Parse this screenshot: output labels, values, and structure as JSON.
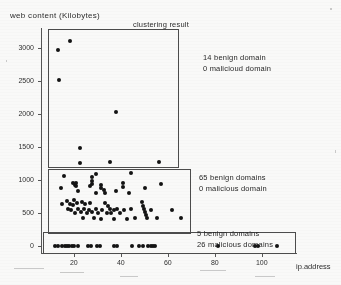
{
  "figure": {
    "title": "clustering result",
    "ylabel": "web  content (Kilobytes)",
    "xlabel": "ip  address"
  },
  "chart_data": {
    "type": "scatter",
    "title": "clustering result",
    "xlabel": "ip  address",
    "ylabel": "web  content (Kilobytes)",
    "xlim": [
      6,
      115
    ],
    "ylim": [
      -120,
      3300
    ],
    "grid": false,
    "legend": "none",
    "xticks": [
      20,
      40,
      60,
      80,
      100
    ],
    "yticks": [
      0,
      500,
      1000,
      1500,
      2000,
      2500,
      3000
    ],
    "xtick_labels": [
      "20",
      "40",
      "60",
      "80",
      "100"
    ],
    "ytick_labels": [
      "0",
      "500",
      "1000",
      "1500",
      "2000",
      "2500",
      "3000"
    ],
    "clusters": [
      {
        "id": 1,
        "annotation": [
          "14 benign domain",
          "0 malicioud domain"
        ],
        "benign": 14,
        "malicious": 0,
        "box": {
          "x0": 8.5,
          "y0": 1180,
          "x1": 64.5,
          "y1": 3290
        },
        "points": [
          [
            13.0,
            2960
          ],
          [
            18.0,
            3105
          ],
          [
            13.2,
            2515
          ],
          [
            37.5,
            2035
          ],
          [
            22.0,
            1490
          ],
          [
            22.2,
            1262
          ],
          [
            35.0,
            1268
          ],
          [
            56.0,
            1272
          ],
          [
            15.5,
            1053
          ],
          [
            19.0,
            960
          ],
          [
            20.2,
            928
          ],
          [
            27.4,
            1040
          ],
          [
            27.4,
            985
          ],
          [
            27.4,
            935
          ]
        ]
      },
      {
        "id": 2,
        "annotation": [
          "65 benign domains",
          "0 malicious domain"
        ],
        "benign": 65,
        "malicious": 0,
        "box": {
          "x0": 8.5,
          "y0": 190,
          "x1": 69.5,
          "y1": 1160
        },
        "points": [
          [
            29.0,
            1090
          ],
          [
            44.0,
            1110
          ],
          [
            14.0,
            880
          ],
          [
            20.5,
            960
          ],
          [
            20.5,
            905
          ],
          [
            21.5,
            840
          ],
          [
            26.5,
            915
          ],
          [
            31.0,
            930
          ],
          [
            31.3,
            878
          ],
          [
            32.5,
            845
          ],
          [
            40.5,
            955
          ],
          [
            40.5,
            890
          ],
          [
            50.0,
            885
          ],
          [
            56.5,
            940
          ],
          [
            29.0,
            800
          ],
          [
            33.0,
            800
          ],
          [
            37.5,
            830
          ],
          [
            43.0,
            800
          ],
          [
            14.5,
            640
          ],
          [
            16.5,
            675
          ],
          [
            18.0,
            640
          ],
          [
            19.5,
            690
          ],
          [
            19.0,
            620
          ],
          [
            21.0,
            650
          ],
          [
            23.0,
            672
          ],
          [
            24.5,
            640
          ],
          [
            26.5,
            655
          ],
          [
            17.0,
            560
          ],
          [
            18.5,
            540
          ],
          [
            20.0,
            505
          ],
          [
            21.5,
            560
          ],
          [
            22.5,
            520
          ],
          [
            24.0,
            560
          ],
          [
            25.0,
            500
          ],
          [
            26.0,
            545
          ],
          [
            27.5,
            515
          ],
          [
            29.0,
            560
          ],
          [
            30.0,
            505
          ],
          [
            31.5,
            545
          ],
          [
            33.0,
            650
          ],
          [
            34.0,
            600
          ],
          [
            35.0,
            560
          ],
          [
            33.5,
            505
          ],
          [
            35.5,
            500
          ],
          [
            36.5,
            540
          ],
          [
            38.0,
            560
          ],
          [
            39.0,
            505
          ],
          [
            41.0,
            540
          ],
          [
            44.0,
            555
          ],
          [
            45.5,
            430
          ],
          [
            48.5,
            660
          ],
          [
            49.0,
            610
          ],
          [
            49.5,
            560
          ],
          [
            50.0,
            520
          ],
          [
            50.2,
            470
          ],
          [
            50.5,
            425
          ],
          [
            52.5,
            545
          ],
          [
            55.0,
            430
          ],
          [
            61.5,
            545
          ],
          [
            65.0,
            420
          ],
          [
            23.5,
            430
          ],
          [
            28.0,
            430
          ],
          [
            31.0,
            410
          ],
          [
            36.5,
            415
          ],
          [
            42.0,
            405
          ]
        ]
      },
      {
        "id": 3,
        "annotation": [
          "5 benign domains",
          "26 malicious domains"
        ],
        "benign": 5,
        "malicious": 26,
        "box": {
          "x0": 6.5,
          "y0": -115,
          "x1": 114.0,
          "y1": 210
        },
        "points": [
          [
            11.5,
            0
          ],
          [
            13.0,
            0
          ],
          [
            14.5,
            0
          ],
          [
            15.6,
            0
          ],
          [
            16.6,
            0
          ],
          [
            17.6,
            0
          ],
          [
            18.6,
            0
          ],
          [
            19.8,
            0
          ],
          [
            21.5,
            0
          ],
          [
            25.5,
            0
          ],
          [
            26.8,
            0
          ],
          [
            29.5,
            0
          ],
          [
            30.8,
            0
          ],
          [
            36.5,
            0
          ],
          [
            37.8,
            0
          ],
          [
            44.5,
            0
          ],
          [
            47.5,
            0
          ],
          [
            49.0,
            0
          ],
          [
            51.0,
            0
          ],
          [
            52.3,
            0
          ],
          [
            53.3,
            0
          ],
          [
            54.3,
            0
          ],
          [
            81.0,
            0
          ],
          [
            96.5,
            0
          ],
          [
            98.0,
            0
          ],
          [
            106.0,
            0
          ]
        ]
      }
    ]
  }
}
